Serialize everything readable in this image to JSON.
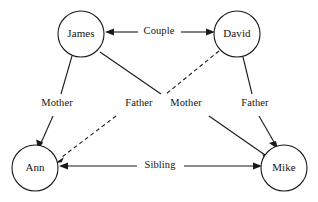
{
  "diagram": {
    "type": "family-relationship-graph",
    "title": "",
    "width": 318,
    "height": 202,
    "background_color": "#ffffff",
    "stroke_color": "#1a1a1a",
    "nodes": [
      {
        "id": "james",
        "label": "James",
        "cx": 81,
        "cy": 34,
        "r": 23
      },
      {
        "id": "david",
        "label": "David",
        "cx": 237,
        "cy": 34,
        "r": 23
      },
      {
        "id": "ann",
        "label": "Ann",
        "cx": 35,
        "cy": 168,
        "r": 23
      },
      {
        "id": "mike",
        "label": "Mike",
        "cx": 284,
        "cy": 168,
        "r": 23
      }
    ],
    "edges": [
      {
        "id": "couple",
        "label": "Couple",
        "from": "james",
        "to": "david",
        "style": "solid",
        "direction": "bidirectional",
        "label_x": 159,
        "label_y": 32
      },
      {
        "id": "james-ann-mother",
        "label": "Mother",
        "from": "james",
        "to": "ann",
        "style": "solid",
        "direction": "forward",
        "label_x": 57,
        "label_y": 104
      },
      {
        "id": "david-ann-father",
        "label": "Father",
        "from": "david",
        "to": "ann",
        "style": "dashed",
        "direction": "forward",
        "label_x": 139,
        "label_y": 104
      },
      {
        "id": "james-mike-mother",
        "label": "Mother",
        "from": "james",
        "to": "mike",
        "style": "solid",
        "direction": "forward",
        "label_x": 186,
        "label_y": 104
      },
      {
        "id": "david-mike-father",
        "label": "Father",
        "from": "david",
        "to": "mike",
        "style": "solid",
        "direction": "forward",
        "label_x": 255,
        "label_y": 104
      },
      {
        "id": "ann-mike-sibling",
        "label": "Sibling",
        "from": "ann",
        "to": "mike",
        "style": "solid",
        "direction": "bidirectional",
        "label_x": 160,
        "label_y": 166
      }
    ]
  }
}
